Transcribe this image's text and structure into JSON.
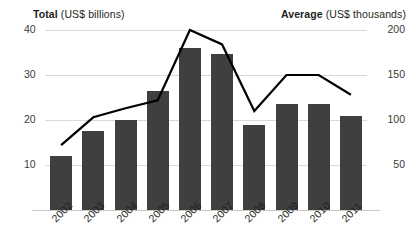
{
  "header": {
    "left_bold": "Total",
    "left_rest": " (US$ billions)",
    "right_bold": "Average",
    "right_rest": " (US$ thousands)"
  },
  "chart_data": {
    "type": "bar",
    "title": "",
    "subtitle": "",
    "xlabel": "",
    "ylabel": "Total (US$ billions)",
    "y2label": "Average (US$ thousands)",
    "grid": true,
    "legend_position": "top",
    "categories": [
      "2002",
      "2003",
      "2004",
      "2005",
      "2006",
      "2007",
      "2008",
      "2009",
      "2010",
      "2011"
    ],
    "ylim": [
      0,
      45
    ],
    "yticks": [
      10,
      20,
      30,
      40
    ],
    "ytick_labels": [
      "10",
      "20",
      "30",
      "40"
    ],
    "y2lim": [
      0,
      225
    ],
    "y2ticks": [
      50,
      100,
      150,
      200
    ],
    "y2tick_labels": [
      "50",
      "100",
      "150",
      "200"
    ],
    "series": [
      {
        "name": "Total",
        "type": "bar",
        "axis": "left",
        "unit": "US$ billions",
        "color": "#3f3f3f",
        "values": [
          12,
          17.5,
          20,
          26.5,
          36,
          34.7,
          19,
          23.5,
          23.5,
          21
        ]
      },
      {
        "name": "Average",
        "type": "line",
        "axis": "right",
        "unit": "US$ thousands",
        "color": "#000000",
        "values": [
          72,
          103,
          113,
          122,
          200,
          184,
          110,
          150,
          150,
          128
        ]
      }
    ]
  }
}
